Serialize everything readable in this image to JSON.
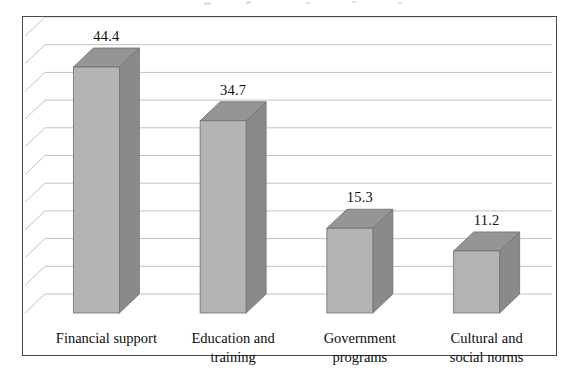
{
  "chart_data": {
    "type": "bar",
    "title": "",
    "subtitle": "",
    "xlabel": "",
    "ylabel": "",
    "categories": [
      "Financial support",
      "Education and\ntraining",
      "Government\nprograms",
      "Cultural and\nsocial norms"
    ],
    "values": [
      44.4,
      34.7,
      15.3,
      11.2
    ],
    "value_labels": [
      "44.4",
      "34.7",
      "15.3",
      "11.2"
    ],
    "ylim": [
      0,
      50
    ],
    "gridlines": 10,
    "grid": true,
    "legend": false,
    "three_d": true,
    "style": {
      "bar_front_color": "#b4b4b4",
      "bar_side_color": "#8a8a8a",
      "bar_top_color": "#959595",
      "bar_edge_color": "#6f6f6f",
      "gridline_color": "#c2c2c2",
      "frame_color": "#4a4a4a",
      "background_color": "#ffffff",
      "label_color": "#0d0d0d"
    }
  },
  "labels": {
    "value_0": "44.4",
    "value_1": "34.7",
    "value_2": "15.3",
    "value_3": "11.2",
    "category_0": "Financial support",
    "category_1": "Education and\ntraining",
    "category_2": "Government\nprograms",
    "category_3": "Cultural and\nsocial norms"
  }
}
